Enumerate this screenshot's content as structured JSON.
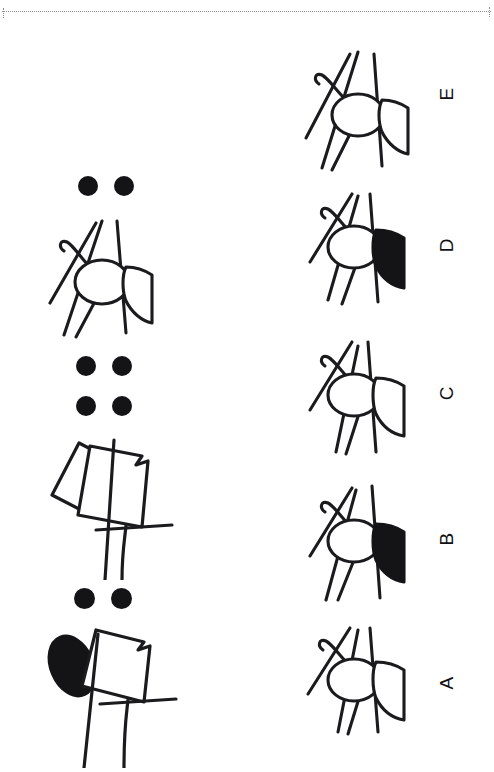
{
  "page": {
    "kind": "figure-analogy-test-page",
    "orientation": "rotated-90-ccw",
    "background_color": "#ffffff",
    "ink_color": "#141417",
    "rule_color": "#8d8d91",
    "width": 494,
    "height": 772
  },
  "header_rule": {
    "style": "dotted",
    "label": ""
  },
  "stimulus": {
    "label": "",
    "items": [
      {
        "id": "stimulus-1",
        "name": "stimulus-figure-1",
        "dot_count": 2,
        "dot_layout": "1x2",
        "body_style": "quadrilateral-open",
        "blob": "filled-ellipse",
        "fill": "partial",
        "description": "quadrilateral body with filled ellipse at left and two legs"
      },
      {
        "id": "stimulus-2",
        "name": "stimulus-figure-2",
        "dot_count": 4,
        "dot_layout": "2x2",
        "body_style": "quadrilateral-open",
        "blob": "open-rectangle",
        "fill": "none",
        "description": "quadrilateral body with open tilted rectangle at left and two legs"
      },
      {
        "id": "stimulus-3",
        "name": "stimulus-figure-3",
        "dot_count": 2,
        "dot_layout": "1x2",
        "body_style": "oval-and-fan",
        "blob": "open-fan",
        "fill": "none",
        "description": "oval body with open fan wing, hooked antenna and four legs"
      }
    ]
  },
  "options": {
    "label": "",
    "items": [
      {
        "id": "A",
        "label": "A",
        "fan_fill": "none",
        "fan_fill_color": "#ffffff",
        "legs": 4,
        "antenna": "hook",
        "description": "oval body, open fan wing"
      },
      {
        "id": "B",
        "label": "B",
        "fan_fill": "solid",
        "fan_fill_color": "#141417",
        "legs": 4,
        "antenna": "hook",
        "description": "oval body, solid black fan wing"
      },
      {
        "id": "C",
        "label": "C",
        "fan_fill": "none",
        "fan_fill_color": "#ffffff",
        "legs": 4,
        "antenna": "hook",
        "description": "oval body, open fan wing"
      },
      {
        "id": "D",
        "label": "D",
        "fan_fill": "solid",
        "fan_fill_color": "#141417",
        "legs": 4,
        "antenna": "hook",
        "description": "oval body, solid black fan wing"
      },
      {
        "id": "E",
        "label": "E",
        "fan_fill": "none",
        "fan_fill_color": "#ffffff",
        "legs": 4,
        "antenna": "hook",
        "description": "oval body, open fan wing, legs shifted"
      }
    ]
  }
}
